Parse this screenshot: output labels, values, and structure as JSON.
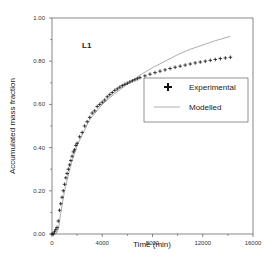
{
  "chart_data": {
    "type": "line",
    "title": "",
    "panel_label": "L1",
    "xlabel": "Time (min)",
    "ylabel": "Accumulated mass fraction",
    "xlim": [
      0,
      16000
    ],
    "ylim": [
      0,
      1.0
    ],
    "x_ticks": [
      0,
      4000,
      8000,
      12000,
      16000
    ],
    "x_tick_labels": [
      "0",
      "4000",
      "8000",
      "12000",
      "16000"
    ],
    "y_ticks": [
      0.0,
      0.2,
      0.4,
      0.6,
      0.8,
      1.0
    ],
    "y_tick_labels": [
      "0.00",
      "0.20",
      "0.40",
      "0.60",
      "0.80",
      "1.00"
    ],
    "grid": false,
    "legend_position": "center-right",
    "series": [
      {
        "name": "Experimental",
        "style": "markers-plus",
        "x": [
          0,
          100,
          200,
          300,
          400,
          500,
          600,
          700,
          800,
          900,
          1000,
          1100,
          1200,
          1300,
          1400,
          1500,
          1600,
          1700,
          1800,
          1900,
          2000,
          2200,
          2400,
          2600,
          2800,
          3000,
          3200,
          3400,
          3600,
          3800,
          4000,
          4200,
          4400,
          4600,
          4800,
          5000,
          5200,
          5400,
          5600,
          5800,
          6000,
          6200,
          6400,
          6600,
          6800,
          7000,
          7400,
          7800,
          8200,
          8600,
          9000,
          9400,
          9800,
          10200,
          10600,
          11000,
          11400,
          11800,
          12200,
          12600,
          13000,
          13400,
          13800,
          14200
        ],
        "y": [
          0.0,
          0.0,
          0.01,
          0.02,
          0.03,
          0.06,
          0.11,
          0.14,
          0.17,
          0.2,
          0.23,
          0.26,
          0.28,
          0.3,
          0.32,
          0.34,
          0.36,
          0.38,
          0.39,
          0.41,
          0.42,
          0.45,
          0.47,
          0.5,
          0.52,
          0.54,
          0.56,
          0.57,
          0.59,
          0.6,
          0.61,
          0.62,
          0.635,
          0.645,
          0.655,
          0.665,
          0.672,
          0.68,
          0.687,
          0.693,
          0.698,
          0.704,
          0.709,
          0.714,
          0.719,
          0.724,
          0.732,
          0.74,
          0.747,
          0.754,
          0.76,
          0.766,
          0.772,
          0.777,
          0.782,
          0.787,
          0.792,
          0.796,
          0.8,
          0.804,
          0.808,
          0.812,
          0.815,
          0.818
        ]
      },
      {
        "name": "Modelled",
        "style": "thin-line",
        "x": [
          0,
          300,
          500,
          700,
          1000,
          1500,
          2000,
          3000,
          4000,
          5000,
          6000,
          7000,
          8000,
          9000,
          10000,
          11000,
          12000,
          13000,
          14200
        ],
        "y": [
          0.0,
          0.0,
          0.02,
          0.1,
          0.2,
          0.32,
          0.41,
          0.53,
          0.6,
          0.65,
          0.695,
          0.735,
          0.77,
          0.8,
          0.83,
          0.855,
          0.875,
          0.895,
          0.915
        ]
      }
    ],
    "colors": {
      "axis": "#555555",
      "markers": "#111111",
      "model_line": "#777777",
      "legend_border": "#666666"
    }
  }
}
